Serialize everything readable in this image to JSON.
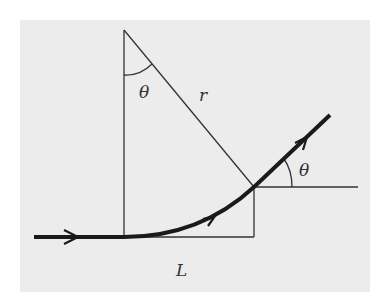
{
  "diagram": {
    "labels": {
      "theta_top": "θ",
      "radius": "r",
      "theta_exit": "θ",
      "width": "L"
    },
    "colors": {
      "background": "#ececec",
      "line": "#333333",
      "trajectory": "#1a1a1a"
    }
  }
}
